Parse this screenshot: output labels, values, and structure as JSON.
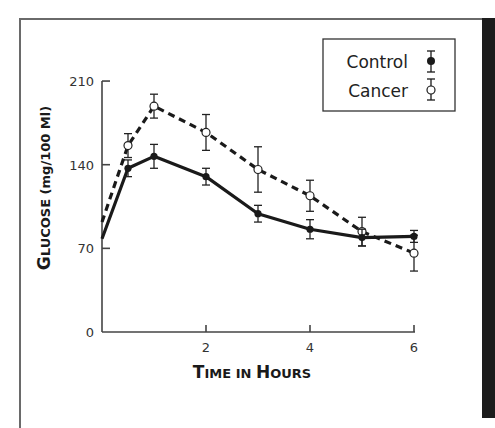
{
  "chart_data": {
    "type": "line",
    "title": "",
    "xlabel": "Time in Hours",
    "ylabel": "Glucose (mg/100 Ml)",
    "xlabel_parts": {
      "big1": "T",
      "small1": "IME IN ",
      "big2": "H",
      "small2": "OURS"
    },
    "ylabel_parts": {
      "big1": "G",
      "small1": "LUCOSE",
      "unit": " (mg/100 Ml)"
    },
    "x_ticks": [
      2,
      4,
      6
    ],
    "y_ticks": [
      0,
      70,
      140,
      210
    ],
    "xlim": [
      0,
      6
    ],
    "ylim": [
      0,
      210
    ],
    "grid": false,
    "legend_position": "upper right",
    "series": [
      {
        "name": "Control",
        "marker": "filled-circle",
        "line_style": "solid",
        "color": "#1a1a1a",
        "x": [
          0,
          0.5,
          1,
          2,
          3,
          4,
          5,
          6
        ],
        "values": [
          78,
          137,
          147,
          130,
          99,
          86,
          79,
          80
        ],
        "errors": [
          null,
          7,
          10,
          7,
          7,
          8,
          7,
          5
        ]
      },
      {
        "name": "Cancer",
        "marker": "open-circle",
        "line_style": "dashed",
        "color": "#1a1a1a",
        "x": [
          0,
          0.5,
          1,
          2,
          3,
          4,
          5,
          6
        ],
        "values": [
          92,
          156,
          189,
          167,
          136,
          114,
          84,
          66
        ],
        "errors": [
          null,
          10,
          10,
          15,
          19,
          13,
          12,
          15
        ]
      }
    ]
  },
  "legend": {
    "items": [
      {
        "label": "Control"
      },
      {
        "label": "Cancer"
      }
    ]
  },
  "colors": {
    "frame": "#6a6a6a",
    "side_bar": "#1c1c1c",
    "ink": "#1a1a1a"
  }
}
